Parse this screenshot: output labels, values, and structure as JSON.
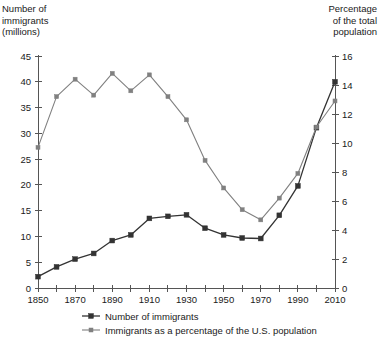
{
  "chart_data": {
    "type": "line",
    "title": "",
    "xlabel": "",
    "ylabel": "Number of immigrants (millions)",
    "y2label": "Percentage of the total population",
    "grid": false,
    "legend_position": "bottom",
    "x": [
      1850,
      1860,
      1870,
      1880,
      1890,
      1900,
      1910,
      1920,
      1930,
      1940,
      1950,
      1960,
      1970,
      1980,
      1990,
      2000,
      2010
    ],
    "xlim": [
      1850,
      2010
    ],
    "xtick_values": [
      1850,
      1860,
      1870,
      1880,
      1890,
      1900,
      1910,
      1920,
      1930,
      1940,
      1950,
      1960,
      1970,
      1980,
      1990,
      2000,
      2010
    ],
    "xtick_labels": [
      "1850",
      "",
      "1870",
      "",
      "1890",
      "",
      "1910",
      "",
      "1930",
      "",
      "1950",
      "",
      "1970",
      "",
      "1990",
      "",
      "2010"
    ],
    "ylim": [
      0,
      45
    ],
    "ytick_labels": [
      "0",
      "5",
      "10",
      "15",
      "20",
      "25",
      "30",
      "35",
      "40",
      "45"
    ],
    "ytick_values": [
      0,
      5,
      10,
      15,
      20,
      25,
      30,
      35,
      40,
      45
    ],
    "y2lim": [
      0,
      16
    ],
    "y2tick_labels": [
      "0",
      "2",
      "4",
      "6",
      "8",
      "10",
      "12",
      "14",
      "16"
    ],
    "y2tick_values": [
      0,
      2,
      4,
      6,
      8,
      10,
      12,
      14,
      16
    ],
    "series": [
      {
        "name": "Number of immigrants",
        "axis": "left",
        "color": "#333333",
        "marker": "square",
        "values": [
          2.2,
          4.1,
          5.6,
          6.7,
          9.2,
          10.3,
          13.5,
          13.9,
          14.2,
          11.6,
          10.3,
          9.7,
          9.6,
          14.1,
          19.8,
          31.1,
          40.0
        ]
      },
      {
        "name": "Immigrants as a percentage of the U.S. population",
        "axis": "right",
        "color": "#808080",
        "marker": "square",
        "values": [
          9.7,
          13.2,
          14.4,
          13.3,
          14.8,
          13.6,
          14.7,
          13.2,
          11.6,
          8.8,
          6.9,
          5.4,
          4.7,
          6.2,
          7.9,
          11.1,
          12.9
        ]
      }
    ],
    "legend": [
      "Number of immigrants",
      "Immigrants as a percentage of the U.S. population"
    ]
  },
  "labels": {
    "left_axis_title": "Number of\nimmigrants\n(millions)",
    "right_axis_title": "Percentage\nof the total\npopulation"
  },
  "colors": {
    "immigrants_line": "#333333",
    "percentage_line": "#808080",
    "axis": "#555555",
    "text": "#1a1a1a",
    "background": "#ffffff"
  }
}
